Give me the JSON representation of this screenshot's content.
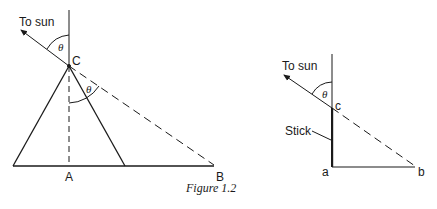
{
  "figure": {
    "caption": "Figure 1.2",
    "left_diagram": {
      "sun_label": "To sun",
      "apex_label": "C",
      "point_a_label": "A",
      "point_b_label": "B",
      "angle_upper_label": "θ",
      "angle_lower_label": "θ"
    },
    "right_diagram": {
      "sun_label": "To sun",
      "top_label": "c",
      "point_a_label": "a",
      "point_b_label": "b",
      "stick_label": "Stick",
      "angle_label": "θ"
    },
    "colors": {
      "ink": "#1a1a1a",
      "background": "#ffffff"
    }
  }
}
